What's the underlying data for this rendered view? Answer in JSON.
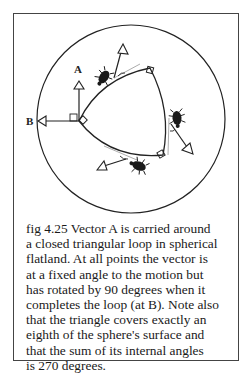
{
  "figure": {
    "labels": {
      "vector_a": "A",
      "vector_b": "B"
    },
    "icons": [
      "beetle-icon",
      "beetle-icon",
      "beetle-icon"
    ],
    "caption_lines": [
      "fig 4.25 Vector A is carried around",
      "a closed triangular loop in spherical",
      "flatland. At all points the vector is",
      "at a fixed angle to the motion but",
      "has rotated by 90 degrees when it",
      "completes the loop (at B). Note also",
      "that the triangle covers exactly an",
      "eighth  of the sphere's surface and",
      "that the sum of its internal angles",
      "is 270 degrees."
    ]
  }
}
